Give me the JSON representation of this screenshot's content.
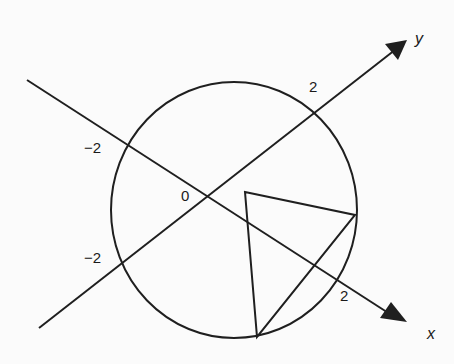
{
  "diagram": {
    "stroke_color": "#1f1f1f",
    "background_color": "#fbfbfb",
    "axes": {
      "x": {
        "name": "x",
        "pos_label": "2",
        "neg_label": "−2"
      },
      "y": {
        "name": "y",
        "pos_label": "2",
        "neg_label": "−2"
      },
      "origin_label": "0"
    },
    "circle": {
      "radius_value": 2
    },
    "triangle": {
      "vertex_count": 3,
      "inscribed": true
    }
  }
}
